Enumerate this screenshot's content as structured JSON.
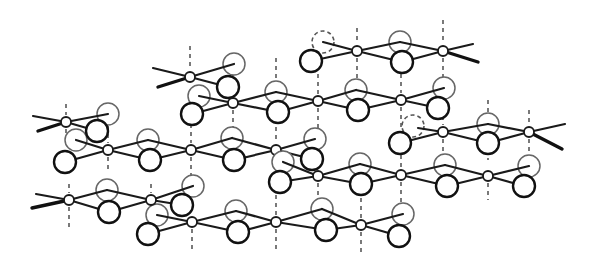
{
  "figure": {
    "title": "",
    "colors": {
      "line": "#1a1a1a",
      "background": "#ffffff"
    },
    "metal_radius": 5,
    "ligand_radius": 11
  },
  "chains": [
    {
      "id": "chain-1",
      "metals": [
        [
          357,
          51
        ],
        [
          443,
          51
        ]
      ],
      "ligands": [
        {
          "x": 323,
          "y": 42,
          "style": "dashed"
        },
        {
          "x": 311,
          "y": 61,
          "style": "front"
        },
        {
          "x": 400,
          "y": 42,
          "style": "faint"
        },
        {
          "x": 402,
          "y": 62,
          "style": "front"
        }
      ],
      "bonds": [
        [
          323,
          42,
          357,
          51
        ],
        [
          311,
          61,
          357,
          51
        ],
        [
          357,
          51,
          400,
          42
        ],
        [
          357,
          51,
          402,
          62
        ],
        [
          400,
          42,
          443,
          51
        ],
        [
          402,
          62,
          443,
          51
        ],
        [
          443,
          51,
          473,
          44
        ],
        [
          443,
          51,
          478,
          62,
          "wedge"
        ]
      ]
    },
    {
      "id": "chain-2",
      "metals": [
        [
          190,
          77
        ],
        [
          233,
          103
        ],
        [
          318,
          101
        ],
        [
          401,
          100
        ]
      ],
      "ligands": [
        {
          "x": 234,
          "y": 64,
          "style": "faint"
        },
        {
          "x": 228,
          "y": 87,
          "style": "front"
        },
        {
          "x": 199,
          "y": 96,
          "style": "faint"
        },
        {
          "x": 192,
          "y": 114,
          "style": "front"
        },
        {
          "x": 276,
          "y": 92,
          "style": "faint"
        },
        {
          "x": 278,
          "y": 112,
          "style": "front"
        },
        {
          "x": 356,
          "y": 90,
          "style": "faint"
        },
        {
          "x": 358,
          "y": 110,
          "style": "front"
        },
        {
          "x": 444,
          "y": 88,
          "style": "faint"
        },
        {
          "x": 438,
          "y": 108,
          "style": "front"
        }
      ],
      "bonds": [
        [
          153,
          68,
          190,
          77
        ],
        [
          158,
          87,
          190,
          77,
          "wedge"
        ],
        [
          190,
          77,
          234,
          64
        ],
        [
          190,
          77,
          228,
          87
        ],
        [
          199,
          96,
          233,
          103
        ],
        [
          192,
          114,
          233,
          103
        ],
        [
          233,
          103,
          276,
          92
        ],
        [
          233,
          103,
          278,
          112
        ],
        [
          276,
          92,
          318,
          101
        ],
        [
          278,
          112,
          318,
          101
        ],
        [
          318,
          101,
          356,
          90
        ],
        [
          318,
          101,
          358,
          110
        ],
        [
          356,
          90,
          401,
          100
        ],
        [
          358,
          110,
          401,
          100
        ],
        [
          401,
          100,
          444,
          88
        ],
        [
          401,
          100,
          438,
          108
        ]
      ]
    },
    {
      "id": "chain-3",
      "metals": [
        [
          66,
          122
        ],
        [
          108,
          150
        ],
        [
          191,
          150
        ],
        [
          276,
          150
        ]
      ],
      "ligands": [
        {
          "x": 108,
          "y": 114,
          "style": "faint"
        },
        {
          "x": 97,
          "y": 131,
          "style": "front"
        },
        {
          "x": 76,
          "y": 140,
          "style": "faint"
        },
        {
          "x": 65,
          "y": 162,
          "style": "front"
        },
        {
          "x": 148,
          "y": 140,
          "style": "faint"
        },
        {
          "x": 150,
          "y": 160,
          "style": "front"
        },
        {
          "x": 232,
          "y": 138,
          "style": "faint"
        },
        {
          "x": 234,
          "y": 160,
          "style": "front"
        },
        {
          "x": 315,
          "y": 139,
          "style": "faint"
        },
        {
          "x": 312,
          "y": 159,
          "style": "front"
        }
      ],
      "bonds": [
        [
          33,
          116,
          66,
          122
        ],
        [
          38,
          131,
          66,
          122,
          "wedge"
        ],
        [
          66,
          122,
          108,
          114
        ],
        [
          66,
          122,
          97,
          131
        ],
        [
          76,
          140,
          108,
          150
        ],
        [
          65,
          162,
          108,
          150
        ],
        [
          108,
          150,
          148,
          140
        ],
        [
          108,
          150,
          150,
          160
        ],
        [
          148,
          140,
          191,
          150
        ],
        [
          150,
          160,
          191,
          150
        ],
        [
          191,
          150,
          232,
          138
        ],
        [
          191,
          150,
          234,
          160
        ],
        [
          232,
          138,
          276,
          150
        ],
        [
          234,
          160,
          276,
          150
        ],
        [
          276,
          150,
          315,
          139
        ],
        [
          276,
          150,
          312,
          159
        ]
      ]
    },
    {
      "id": "chain-4",
      "metals": [
        [
          443,
          132
        ],
        [
          529,
          132
        ]
      ],
      "ligands": [
        {
          "x": 413,
          "y": 126,
          "style": "dashed"
        },
        {
          "x": 400,
          "y": 143,
          "style": "front"
        },
        {
          "x": 488,
          "y": 124,
          "style": "faint"
        },
        {
          "x": 488,
          "y": 143,
          "style": "front"
        }
      ],
      "bonds": [
        [
          418,
          128,
          443,
          132
        ],
        [
          400,
          143,
          443,
          132
        ],
        [
          443,
          132,
          488,
          124
        ],
        [
          443,
          132,
          488,
          143
        ],
        [
          488,
          124,
          529,
          132
        ],
        [
          488,
          143,
          529,
          132
        ],
        [
          529,
          132,
          565,
          124
        ],
        [
          529,
          132,
          562,
          149,
          "wedge"
        ]
      ]
    },
    {
      "id": "chain-5",
      "metals": [
        [
          318,
          176
        ],
        [
          401,
          175
        ],
        [
          488,
          176
        ]
      ],
      "ligands": [
        {
          "x": 283,
          "y": 162,
          "style": "faint"
        },
        {
          "x": 280,
          "y": 182,
          "style": "front"
        },
        {
          "x": 360,
          "y": 164,
          "style": "faint"
        },
        {
          "x": 361,
          "y": 184,
          "style": "front"
        },
        {
          "x": 445,
          "y": 165,
          "style": "faint"
        },
        {
          "x": 447,
          "y": 186,
          "style": "front"
        },
        {
          "x": 529,
          "y": 166,
          "style": "faint"
        },
        {
          "x": 524,
          "y": 186,
          "style": "front"
        }
      ],
      "bonds": [
        [
          283,
          162,
          318,
          176
        ],
        [
          280,
          182,
          318,
          176
        ],
        [
          318,
          176,
          360,
          164
        ],
        [
          318,
          176,
          361,
          184
        ],
        [
          360,
          164,
          401,
          175
        ],
        [
          361,
          184,
          401,
          175
        ],
        [
          401,
          175,
          445,
          165
        ],
        [
          401,
          175,
          447,
          186
        ],
        [
          445,
          165,
          488,
          176
        ],
        [
          447,
          186,
          488,
          176
        ],
        [
          488,
          176,
          529,
          166
        ],
        [
          488,
          176,
          524,
          186
        ]
      ]
    },
    {
      "id": "chain-6",
      "metals": [
        [
          69,
          200
        ],
        [
          151,
          200
        ],
        [
          192,
          222
        ],
        [
          276,
          222
        ],
        [
          361,
          225
        ]
      ],
      "ligands": [
        {
          "x": 107,
          "y": 190,
          "style": "faint"
        },
        {
          "x": 109,
          "y": 212,
          "style": "front"
        },
        {
          "x": 193,
          "y": 186,
          "style": "faint"
        },
        {
          "x": 182,
          "y": 205,
          "style": "front"
        },
        {
          "x": 157,
          "y": 215,
          "style": "faint"
        },
        {
          "x": 148,
          "y": 234,
          "style": "front"
        },
        {
          "x": 236,
          "y": 211,
          "style": "faint"
        },
        {
          "x": 238,
          "y": 232,
          "style": "front"
        },
        {
          "x": 322,
          "y": 209,
          "style": "faint"
        },
        {
          "x": 326,
          "y": 230,
          "style": "front"
        },
        {
          "x": 403,
          "y": 214,
          "style": "faint"
        },
        {
          "x": 399,
          "y": 236,
          "style": "front"
        }
      ],
      "bonds": [
        [
          36,
          194,
          69,
          200
        ],
        [
          32,
          208,
          69,
          200,
          "wedge"
        ],
        [
          69,
          200,
          107,
          190
        ],
        [
          69,
          200,
          109,
          212
        ],
        [
          107,
          190,
          151,
          200
        ],
        [
          109,
          212,
          151,
          200
        ],
        [
          151,
          200,
          193,
          186
        ],
        [
          151,
          200,
          182,
          205
        ],
        [
          157,
          215,
          192,
          222
        ],
        [
          148,
          234,
          192,
          222
        ],
        [
          192,
          222,
          236,
          211
        ],
        [
          192,
          222,
          238,
          232
        ],
        [
          236,
          211,
          276,
          222
        ],
        [
          238,
          232,
          276,
          222
        ],
        [
          276,
          222,
          322,
          209
        ],
        [
          276,
          222,
          326,
          230
        ],
        [
          322,
          209,
          361,
          225
        ],
        [
          326,
          230,
          361,
          225
        ],
        [
          361,
          225,
          403,
          214
        ],
        [
          361,
          225,
          399,
          236
        ]
      ]
    }
  ],
  "stacking_lines": [
    [
      190,
      46,
      190,
      70
    ],
    [
      233,
      64,
      233,
      96
    ],
    [
      233,
      110,
      233,
      130
    ],
    [
      357,
      28,
      357,
      44
    ],
    [
      443,
      20,
      443,
      44
    ],
    [
      443,
      58,
      443,
      80
    ],
    [
      401,
      58,
      401,
      93
    ],
    [
      357,
      58,
      357,
      78
    ],
    [
      318,
      58,
      318,
      94
    ],
    [
      276,
      58,
      276,
      80
    ],
    [
      66,
      104,
      66,
      115
    ],
    [
      66,
      129,
      66,
      145
    ],
    [
      108,
      126,
      108,
      143
    ],
    [
      108,
      157,
      108,
      172
    ],
    [
      191,
      108,
      191,
      143
    ],
    [
      191,
      157,
      191,
      180
    ],
    [
      276,
      119,
      276,
      143
    ],
    [
      276,
      157,
      276,
      172
    ],
    [
      318,
      108,
      318,
      169
    ],
    [
      401,
      107,
      401,
      168
    ],
    [
      443,
      100,
      443,
      125
    ],
    [
      443,
      139,
      443,
      158
    ],
    [
      488,
      100,
      488,
      113
    ],
    [
      488,
      150,
      488,
      160
    ],
    [
      529,
      110,
      529,
      125
    ],
    [
      529,
      139,
      529,
      155
    ],
    [
      488,
      183,
      488,
      200
    ],
    [
      401,
      182,
      401,
      203
    ],
    [
      69,
      184,
      69,
      193
    ],
    [
      69,
      207,
      69,
      228
    ],
    [
      151,
      184,
      151,
      193
    ],
    [
      151,
      207,
      151,
      215
    ],
    [
      192,
      229,
      192,
      250
    ],
    [
      276,
      195,
      276,
      215
    ],
    [
      276,
      229,
      276,
      250
    ],
    [
      318,
      183,
      318,
      205
    ],
    [
      361,
      232,
      361,
      255
    ],
    [
      361,
      190,
      361,
      218
    ]
  ]
}
